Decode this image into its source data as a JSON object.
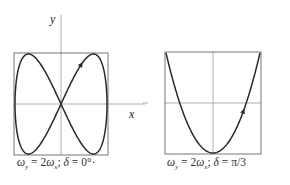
{
  "figures": [
    {
      "id": "left",
      "axis_x_label": "x",
      "axis_y_label": "y",
      "caption": "ω_y = 2ω_x; δ = 0°",
      "caption_display": "ωy = 2ωx; δ = 0°·",
      "freq_ratio": 2,
      "phase": "0°"
    },
    {
      "id": "right",
      "caption": "ω_y = 2ω_x; δ = π/3",
      "caption_display": "ωy = 2ωx; δ = π/3",
      "freq_ratio": 2,
      "phase": "π/3"
    }
  ],
  "colors": {
    "curve": "#2a2a2a",
    "axis": "#888888",
    "box": "#555555"
  }
}
